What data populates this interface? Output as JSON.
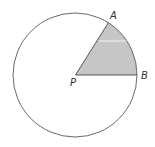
{
  "diagram": {
    "circle": {
      "center": [
        75,
        75
      ],
      "radius": 62,
      "stroke": "#555555"
    },
    "sector": {
      "vertex_label": "P",
      "point_a_label": "A",
      "point_b_label": "B",
      "fill": "#c6c6c6",
      "shaded": true
    },
    "labels": {
      "a": "A",
      "b": "B",
      "p": "P"
    }
  }
}
